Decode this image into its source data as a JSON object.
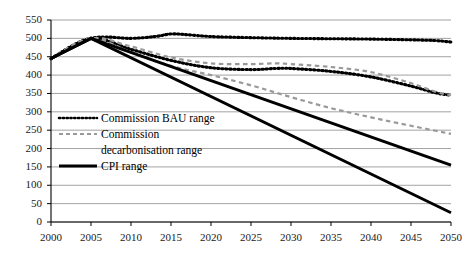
{
  "chart_data": {
    "type": "line",
    "title": "",
    "xlabel": "",
    "ylabel": "",
    "xlim": [
      2000,
      2050
    ],
    "ylim": [
      0,
      550
    ],
    "ytick_values": [
      0,
      50,
      100,
      150,
      200,
      250,
      300,
      350,
      400,
      450,
      500,
      550
    ],
    "ytick_labels": [
      "0",
      "50",
      "100",
      "150",
      "200",
      "250",
      "300",
      "350",
      "400",
      "450",
      "500",
      "550"
    ],
    "xtick_values": [
      2000,
      2005,
      2010,
      2015,
      2020,
      2025,
      2030,
      2035,
      2040,
      2045,
      2050
    ],
    "xtick_labels": [
      "2000",
      "2005",
      "2010",
      "2015",
      "2020",
      "2025",
      "2030",
      "2035",
      "2040",
      "2045",
      "2050"
    ],
    "grid": "horizontal",
    "legend_position": "inside-left",
    "colors": {
      "bau": "#000000",
      "decarbonisation": "#999999",
      "cpi": "#000000",
      "gridline": "#8c8c8c",
      "axis": "#000000"
    },
    "series": [
      {
        "name": "Commission BAU range upper",
        "group": "Commission BAU range",
        "style": "dotted",
        "color": "#000000",
        "x": [
          2000,
          2005,
          2010,
          2013,
          2015,
          2017,
          2020,
          2025,
          2030,
          2035,
          2040,
          2045,
          2048,
          2050
        ],
        "values": [
          445,
          500,
          500,
          505,
          512,
          510,
          505,
          502,
          500,
          499,
          498,
          496,
          494,
          490
        ]
      },
      {
        "name": "Commission BAU range lower",
        "group": "Commission BAU range",
        "style": "dotted",
        "color": "#000000",
        "x": [
          2000,
          2005,
          2010,
          2015,
          2020,
          2025,
          2028,
          2030,
          2035,
          2040,
          2045,
          2048,
          2050
        ],
        "values": [
          445,
          500,
          470,
          440,
          420,
          415,
          418,
          418,
          410,
          395,
          370,
          352,
          345
        ]
      },
      {
        "name": "Commission decarbonisation range upper",
        "group": "Commission decarbonisation range",
        "style": "dashed",
        "color": "#999999",
        "x": [
          2000,
          2005,
          2010,
          2015,
          2020,
          2025,
          2028,
          2030,
          2035,
          2040,
          2045,
          2048,
          2050
        ],
        "values": [
          445,
          500,
          478,
          448,
          432,
          430,
          432,
          430,
          422,
          408,
          378,
          355,
          345
        ]
      },
      {
        "name": "Commission decarbonisation range lower",
        "group": "Commission decarbonisation range",
        "style": "dashed",
        "color": "#999999",
        "x": [
          2000,
          2005,
          2010,
          2015,
          2020,
          2025,
          2030,
          2035,
          2040,
          2045,
          2050
        ],
        "values": [
          445,
          500,
          462,
          425,
          400,
          372,
          340,
          310,
          285,
          262,
          240
        ]
      },
      {
        "name": "CPI range upper",
        "group": "CPI range",
        "style": "solid",
        "color": "#000000",
        "x": [
          2000,
          2005,
          2050
        ],
        "values": [
          445,
          500,
          155
        ]
      },
      {
        "name": "CPI range lower",
        "group": "CPI range",
        "style": "solid",
        "color": "#000000",
        "x": [
          2000,
          2005,
          2050
        ],
        "values": [
          445,
          500,
          25
        ]
      }
    ],
    "legend": [
      {
        "label": "Commission BAU range",
        "style": "dotted",
        "color": "#000000",
        "label2": ""
      },
      {
        "label": "Commission",
        "style": "dashed",
        "color": "#999999",
        "label2": "decarbonisation range"
      },
      {
        "label": "CPI range",
        "style": "solid",
        "color": "#000000",
        "label2": ""
      }
    ]
  }
}
